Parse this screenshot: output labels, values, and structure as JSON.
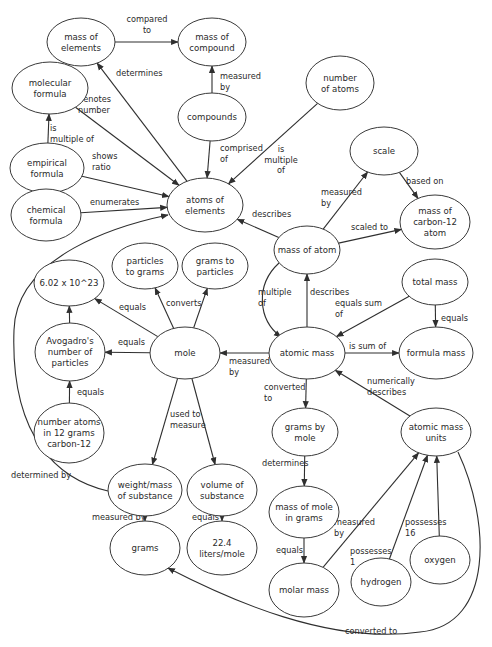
{
  "title": "",
  "nodes": [
    {
      "id": "mass_of_elements",
      "lines": [
        "mass of",
        "elements"
      ]
    },
    {
      "id": "mass_of_compound",
      "lines": [
        "mass of",
        "compound"
      ]
    },
    {
      "id": "molecular_formula",
      "lines": [
        "molecular",
        "formula"
      ]
    },
    {
      "id": "compounds",
      "lines": [
        "compounds"
      ]
    },
    {
      "id": "number_of_atoms",
      "lines": [
        "number",
        "of atoms"
      ]
    },
    {
      "id": "empirical_formula",
      "lines": [
        "empirical",
        "formula"
      ]
    },
    {
      "id": "chemical_formula",
      "lines": [
        "chemical",
        "formula"
      ]
    },
    {
      "id": "atoms_of_elements",
      "lines": [
        "atoms of",
        "elements"
      ]
    },
    {
      "id": "scale",
      "lines": [
        "scale"
      ]
    },
    {
      "id": "mass_of_carbon12_atom",
      "lines": [
        "mass of",
        "carbon-12",
        "atom"
      ]
    },
    {
      "id": "mass_of_atom",
      "lines": [
        "mass of atom"
      ]
    },
    {
      "id": "total_mass",
      "lines": [
        "total mass"
      ]
    },
    {
      "id": "particles_to_grams",
      "lines": [
        "particles",
        "to grams"
      ]
    },
    {
      "id": "grams_to_particles",
      "lines": [
        "grams to",
        "particles"
      ]
    },
    {
      "id": "avogadro_value",
      "lines": [
        "6.02 x 10^23"
      ]
    },
    {
      "id": "avogadros_number",
      "lines": [
        "Avogadro's",
        "number of",
        "particles"
      ]
    },
    {
      "id": "mole",
      "lines": [
        "mole"
      ]
    },
    {
      "id": "atomic_mass",
      "lines": [
        "atomic mass"
      ]
    },
    {
      "id": "formula_mass",
      "lines": [
        "formula mass"
      ]
    },
    {
      "id": "number_atoms_12g",
      "lines": [
        "number atoms",
        "in 12 grams",
        "carbon-12"
      ]
    },
    {
      "id": "grams_by_mole",
      "lines": [
        "grams by",
        "mole"
      ]
    },
    {
      "id": "atomic_mass_units",
      "lines": [
        "atomic mass",
        "units"
      ]
    },
    {
      "id": "weight_mass_of_substance",
      "lines": [
        "weight/mass",
        "of substance"
      ]
    },
    {
      "id": "volume_of_substance",
      "lines": [
        "volume of",
        "substance"
      ]
    },
    {
      "id": "mass_of_mole_in_grams",
      "lines": [
        "mass of mole",
        "in grams"
      ]
    },
    {
      "id": "grams",
      "lines": [
        "grams"
      ]
    },
    {
      "id": "liters_per_mole",
      "lines": [
        "22.4",
        "liters/mole"
      ]
    },
    {
      "id": "oxygen",
      "lines": [
        "oxygen"
      ]
    },
    {
      "id": "hydrogen",
      "lines": [
        "hydrogen"
      ]
    },
    {
      "id": "molar_mass",
      "lines": [
        "molar mass"
      ]
    }
  ],
  "edges": [
    {
      "from": "mass_of_elements",
      "to": "mass_of_compound",
      "label": [
        "compared",
        "to"
      ]
    },
    {
      "from": "compounds",
      "to": "mass_of_compound",
      "label": [
        "measured",
        "by"
      ]
    },
    {
      "from": "atoms_of_elements",
      "to": "mass_of_elements",
      "label": [
        "determines"
      ]
    },
    {
      "from": "molecular_formula",
      "to": "atoms_of_elements",
      "label": [
        "denotes",
        "number"
      ]
    },
    {
      "from": "empirical_formula",
      "to": "molecular_formula",
      "label": [
        "is",
        "multiple of"
      ]
    },
    {
      "from": "compounds",
      "to": "atoms_of_elements",
      "label": [
        "comprised",
        "of"
      ]
    },
    {
      "from": "number_of_atoms",
      "to": "atoms_of_elements",
      "label": [
        "is",
        "multiple",
        "of"
      ]
    },
    {
      "from": "empirical_formula",
      "to": "atoms_of_elements",
      "label": [
        "shows",
        "ratio"
      ]
    },
    {
      "from": "chemical_formula",
      "to": "atoms_of_elements",
      "label": [
        "enumerates"
      ]
    },
    {
      "from": "weight_mass_of_substance",
      "to": "atoms_of_elements",
      "label": [
        "determined by"
      ]
    },
    {
      "from": "mass_of_atom",
      "to": "atoms_of_elements",
      "label": [
        "describes"
      ]
    },
    {
      "from": "mass_of_atom",
      "to": "scale",
      "label": [
        "measured",
        "by"
      ]
    },
    {
      "from": "scale",
      "to": "mass_of_carbon12_atom",
      "label": [
        "based on"
      ]
    },
    {
      "from": "mass_of_atom",
      "to": "mass_of_carbon12_atom",
      "label": [
        "scaled to"
      ]
    },
    {
      "from": "mass_of_atom",
      "to": "atomic_mass",
      "label": [
        "multiple",
        "of"
      ]
    },
    {
      "from": "atomic_mass",
      "to": "mass_of_atom",
      "label": [
        "describes"
      ]
    },
    {
      "from": "total_mass",
      "to": "atomic_mass",
      "label": [
        "equals sum",
        "of"
      ]
    },
    {
      "from": "total_mass",
      "to": "formula_mass",
      "label": [
        "equals"
      ]
    },
    {
      "from": "atomic_mass",
      "to": "formula_mass",
      "label": [
        "is sum of"
      ]
    },
    {
      "from": "mole",
      "to": "particles_to_grams",
      "label": [
        "converts"
      ]
    },
    {
      "from": "mole",
      "to": "grams_to_particles",
      "label": []
    },
    {
      "from": "mole",
      "to": "avogadro_value",
      "label": [
        "equals"
      ]
    },
    {
      "from": "mole",
      "to": "avogadros_number",
      "label": [
        "equals"
      ]
    },
    {
      "from": "avogadros_number",
      "to": "avogadro_value",
      "label": []
    },
    {
      "from": "number_atoms_12g",
      "to": "avogadros_number",
      "label": [
        "equals"
      ]
    },
    {
      "from": "atomic_mass",
      "to": "mole",
      "label": [
        "measured",
        "by"
      ]
    },
    {
      "from": "atomic_mass",
      "to": "grams_by_mole",
      "label": [
        "converted",
        "to"
      ]
    },
    {
      "from": "atomic_mass_units",
      "to": "atomic_mass",
      "label": [
        "numerically",
        "describes"
      ]
    },
    {
      "from": "mole",
      "to": "weight_mass_of_substance",
      "label": [
        "used to",
        "measure"
      ]
    },
    {
      "from": "mole",
      "to": "volume_of_substance",
      "label": []
    },
    {
      "from": "weight_mass_of_substance",
      "to": "grams",
      "label": [
        "measured by"
      ]
    },
    {
      "from": "volume_of_substance",
      "to": "liters_per_mole",
      "label": [
        "equals"
      ]
    },
    {
      "from": "grams_by_mole",
      "to": "mass_of_mole_in_grams",
      "label": [
        "determines"
      ]
    },
    {
      "from": "mass_of_mole_in_grams",
      "to": "molar_mass",
      "label": [
        "equals"
      ]
    },
    {
      "from": "molar_mass",
      "to": "atomic_mass_units",
      "label": [
        "measured",
        "by"
      ]
    },
    {
      "from": "hydrogen",
      "to": "atomic_mass_units",
      "label": [
        "possesses",
        "1"
      ]
    },
    {
      "from": "oxygen",
      "to": "atomic_mass_units",
      "label": [
        "possesses",
        "16"
      ]
    },
    {
      "from": "atomic_mass_units",
      "to": "grams",
      "label": [
        "converted to"
      ]
    }
  ]
}
